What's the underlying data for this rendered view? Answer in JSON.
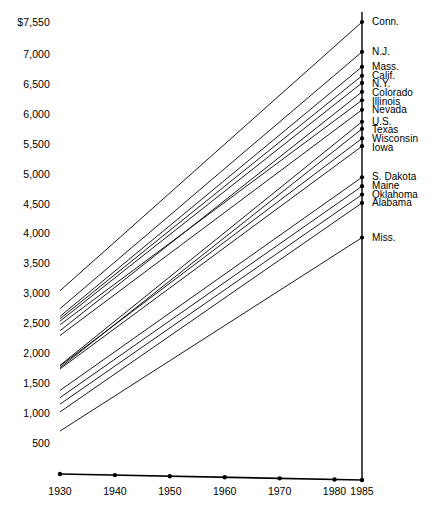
{
  "chart_data": {
    "type": "line",
    "title": "",
    "subtitle": "",
    "xlabel": "",
    "ylabel": "",
    "x": [
      1930,
      1985
    ],
    "xlim": [
      1930,
      1985
    ],
    "ylim": [
      500,
      7550
    ],
    "grid": false,
    "legend_position": "right-endpoint-labels",
    "x_tick_labels": [
      "1930",
      "1940",
      "1950",
      "1960",
      "1970",
      "1980",
      "1985"
    ],
    "x_ticks": [
      1930,
      1940,
      1950,
      1960,
      1970,
      1980,
      1985
    ],
    "y_tick_labels": [
      "$7,550",
      "7,000",
      "6,500",
      "6,000",
      "5,500",
      "5,000",
      "4,500",
      "4,000",
      "3,500",
      "3,000",
      "2,500",
      "2,000",
      "1,500",
      "1,000",
      "500"
    ],
    "y_ticks": [
      7550,
      7000,
      6500,
      6000,
      5500,
      5000,
      4500,
      4000,
      3500,
      3000,
      2500,
      2000,
      1500,
      1000,
      500
    ],
    "series": [
      {
        "name": "Conn.",
        "label": "Conn.",
        "values": [
          3050,
          7550
        ]
      },
      {
        "name": "N.J.",
        "label": "N.J.",
        "values": [
          2750,
          7050
        ]
      },
      {
        "name": "Mass.",
        "label": "Mass.",
        "values": [
          2620,
          6800
        ]
      },
      {
        "name": "Calif.",
        "label": "Calif.",
        "values": [
          2580,
          6650
        ]
      },
      {
        "name": "N.Y.",
        "label": "N.Y.",
        "values": [
          2540,
          6530
        ]
      },
      {
        "name": "Colorado",
        "label": "Colorado",
        "values": [
          2380,
          6380
        ]
      },
      {
        "name": "Illinois",
        "label": "Illinois",
        "values": [
          2480,
          6240
        ]
      },
      {
        "name": "Nevada",
        "label": "Nevada",
        "values": [
          2300,
          6080
        ]
      },
      {
        "name": "U.S.",
        "label": "U.S.",
        "values": [
          1800,
          5880
        ]
      },
      {
        "name": "Texas",
        "label": "Texas",
        "values": [
          1760,
          5760
        ]
      },
      {
        "name": "Wisconsin",
        "label": "Wisconsin",
        "values": [
          1790,
          5600
        ]
      },
      {
        "name": "Iowa",
        "label": "Iowa",
        "values": [
          1740,
          5470
        ]
      },
      {
        "name": "S. Dakota",
        "label": "S. Dakota",
        "values": [
          1380,
          4950
        ]
      },
      {
        "name": "Maine",
        "label": "Maine",
        "values": [
          1260,
          4800
        ]
      },
      {
        "name": "Oklahoma",
        "label": "Oklahoma",
        "values": [
          1150,
          4660
        ]
      },
      {
        "name": "Alabama",
        "label": "Alabama",
        "values": [
          1020,
          4520
        ]
      },
      {
        "name": "Miss.",
        "label": "Miss.",
        "values": [
          700,
          3940
        ]
      }
    ]
  },
  "axis": {
    "y_top_label": "$7,550",
    "x_start_label": "1930",
    "x_end_label": "1985"
  }
}
